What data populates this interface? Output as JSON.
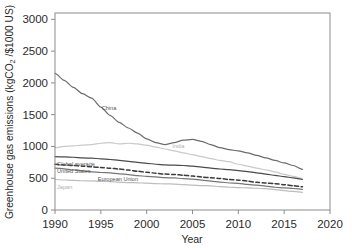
{
  "figure": {
    "y_axis_label": "Greenhouse gas emissions (kgCO",
    "y_axis_label_sub": "2",
    "y_axis_label_tail": " /$1000 US)",
    "x_axis_label": "Year"
  },
  "chart_data": {
    "type": "line",
    "title": "",
    "xlabel": "Year",
    "ylabel": "Greenhouse gas emissions (kgCO2 /$1000 US)",
    "xlim": [
      1990,
      2020
    ],
    "ylim": [
      0,
      3100
    ],
    "xticks": [
      1990,
      1995,
      2000,
      2005,
      2010,
      2015,
      2020
    ],
    "yticks": [
      0,
      500,
      1000,
      1500,
      2000,
      2500,
      3000
    ],
    "grid": false,
    "legend": "inline-labels",
    "x": [
      1990,
      1991,
      1992,
      1993,
      1994,
      1995,
      1996,
      1997,
      1998,
      1999,
      2000,
      2001,
      2002,
      2003,
      2004,
      2005,
      2006,
      2007,
      2008,
      2009,
      2010,
      2011,
      2012,
      2013,
      2014,
      2015,
      2016,
      2017
    ],
    "series": [
      {
        "name": "China",
        "label": "China",
        "color": "#6b6b6b",
        "style": "solid",
        "values": [
          2150,
          2040,
          1930,
          1830,
          1760,
          1620,
          1490,
          1380,
          1290,
          1210,
          1120,
          1060,
          1030,
          1060,
          1100,
          1110,
          1080,
          1030,
          980,
          950,
          930,
          900,
          860,
          820,
          780,
          740,
          700,
          640
        ]
      },
      {
        "name": "India",
        "label": "India",
        "color": "#c9c9c9",
        "style": "solid",
        "values": [
          980,
          1000,
          1010,
          1020,
          1030,
          1050,
          1060,
          1040,
          1050,
          1040,
          1020,
          990,
          960,
          930,
          900,
          870,
          840,
          810,
          780,
          760,
          720,
          690,
          660,
          630,
          600,
          560,
          530,
          500
        ]
      },
      {
        "name": "Global average",
        "label": "Global average",
        "color": "#4a4a4a",
        "style": "solid",
        "values": [
          840,
          835,
          830,
          820,
          815,
          805,
          795,
          780,
          765,
          750,
          735,
          720,
          710,
          705,
          700,
          690,
          675,
          660,
          645,
          635,
          620,
          605,
          585,
          565,
          545,
          525,
          505,
          480
        ]
      },
      {
        "name": "United States",
        "label": "United States",
        "color": "#3a3a3a",
        "style": "dashed",
        "values": [
          720,
          710,
          700,
          690,
          680,
          668,
          658,
          645,
          628,
          610,
          595,
          578,
          565,
          558,
          548,
          535,
          518,
          508,
          495,
          480,
          470,
          455,
          435,
          425,
          415,
          398,
          382,
          365
        ]
      },
      {
        "name": "European Union",
        "label": "European Union",
        "color": "#767676",
        "style": "solid",
        "values": [
          660,
          648,
          630,
          615,
          600,
          590,
          585,
          570,
          558,
          542,
          528,
          520,
          508,
          505,
          495,
          485,
          470,
          455,
          440,
          425,
          420,
          402,
          390,
          375,
          358,
          348,
          338,
          325
        ]
      },
      {
        "name": "Japan",
        "label": "Japan",
        "color": "#bdbdbd",
        "style": "solid",
        "values": [
          480,
          472,
          466,
          460,
          458,
          452,
          448,
          440,
          432,
          428,
          422,
          415,
          412,
          408,
          400,
          392,
          385,
          380,
          368,
          358,
          352,
          348,
          342,
          335,
          320,
          305,
          292,
          278
        ]
      }
    ]
  }
}
